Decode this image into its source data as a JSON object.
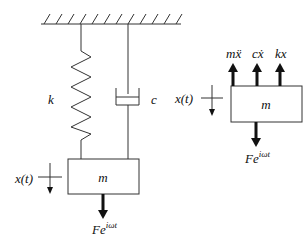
{
  "diagram": {
    "type": "mass-spring-damper system with free-body diagram",
    "system": {
      "spring_label": "k",
      "damper_label": "c",
      "mass_label": "m",
      "displacement_label": "x(t)",
      "force_label_base": "Fe",
      "force_label_sup": "iωt"
    },
    "free_body": {
      "mass_label": "m",
      "displacement_label": "x(t)",
      "upward_forces": [
        "mẍ",
        "cẋ",
        "kx"
      ],
      "force_label_base": "Fe",
      "force_label_sup": "iωt"
    },
    "colors": {
      "line": "#333333",
      "arrow": "#111111",
      "background": "#ffffff"
    }
  }
}
